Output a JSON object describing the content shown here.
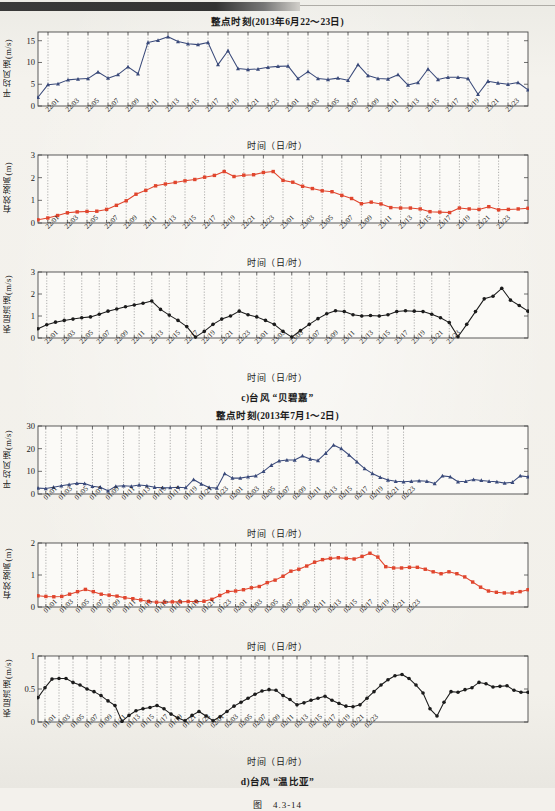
{
  "page": {
    "figure_number": "图",
    "figure_number_value": "4.3-14"
  },
  "groups": [
    {
      "id": "group-c",
      "caption": "c)台风 “贝碧嘉”",
      "title": "整点时刻(2013年6月22～23日)",
      "xaxis_label": "时间（日/时）",
      "xticks": [
        "22/01",
        "22/03",
        "22/05",
        "22/07",
        "22/09",
        "22/11",
        "22/13",
        "22/15",
        "22/17",
        "22/19",
        "22/21",
        "22/23",
        "23/01",
        "23/03",
        "23/05",
        "23/07",
        "23/09",
        "23/11",
        "23/13",
        "23/15",
        "23/17",
        "23/19",
        "23/21",
        "23/23"
      ]
    },
    {
      "id": "group-d",
      "caption": "d)台风 “温比亚”",
      "title": "整点时刻(2013年7月1～2日)",
      "xaxis_label": "时间（日/时）",
      "xticks": [
        "01/01",
        "01/03",
        "01/05",
        "01/07",
        "01/09",
        "01/11",
        "01/13",
        "01/15",
        "01/17",
        "01/19",
        "01/21",
        "01/23",
        "02/01",
        "02/03",
        "02/05",
        "02/07",
        "02/09",
        "02/11",
        "02/13",
        "02/15",
        "02/17",
        "02/19",
        "02/21",
        "02/23"
      ]
    }
  ],
  "chart_data": [
    {
      "id": "c-wind",
      "type": "line",
      "title": "整点时刻(2013年6月22～23日)",
      "xlabel": "时间（日/时）",
      "ylabel": "平均风速(m/s)",
      "ylim": [
        0,
        17
      ],
      "yticks": [
        0,
        5,
        10,
        15
      ],
      "grid": true,
      "marker": "triangle",
      "color": "#3a4a7a",
      "x": [
        "22/00",
        "22/01",
        "22/02",
        "22/03",
        "22/04",
        "22/05",
        "22/06",
        "22/07",
        "22/08",
        "22/09",
        "22/10",
        "22/11",
        "22/12",
        "22/13",
        "22/14",
        "22/15",
        "22/16",
        "22/17",
        "22/18",
        "22/19",
        "22/20",
        "22/21",
        "22/22",
        "22/23",
        "23/00",
        "23/01",
        "23/02",
        "23/03",
        "23/04",
        "23/05",
        "23/06",
        "23/07",
        "23/08",
        "23/09",
        "23/10",
        "23/11",
        "23/12",
        "23/13",
        "23/14",
        "23/15",
        "23/16",
        "23/17",
        "23/18",
        "23/19",
        "23/20",
        "23/21",
        "23/22",
        "23/23"
      ],
      "values": [
        2.0,
        4.9,
        5.1,
        6.0,
        6.2,
        6.3,
        7.8,
        6.4,
        7.2,
        9.0,
        7.4,
        14.6,
        15.1,
        15.9,
        14.8,
        14.3,
        14.1,
        14.6,
        9.5,
        12.7,
        8.6,
        8.4,
        8.5,
        8.9,
        9.1,
        9.2,
        6.3,
        7.9,
        6.3,
        6.1,
        6.4,
        5.9,
        9.5,
        7.0,
        6.3,
        6.2,
        7.2,
        4.8,
        5.4,
        8.5,
        6.1,
        6.6,
        6.6,
        6.3,
        2.7,
        5.7,
        5.3,
        5.0,
        5.4,
        3.7
      ]
    },
    {
      "id": "c-wave",
      "type": "line",
      "title": "",
      "xlabel": "时间（日/时）",
      "ylabel": "有效波高(m)",
      "ylim": [
        0,
        3
      ],
      "yticks": [
        0,
        1,
        2,
        3
      ],
      "grid": true,
      "marker": "square",
      "color": "#e0452d",
      "values": [
        0.14,
        0.22,
        0.33,
        0.45,
        0.49,
        0.51,
        0.52,
        0.6,
        0.78,
        0.98,
        1.27,
        1.44,
        1.64,
        1.72,
        1.79,
        1.86,
        1.92,
        2.02,
        2.1,
        2.27,
        2.05,
        2.11,
        2.13,
        2.23,
        2.27,
        1.88,
        1.8,
        1.62,
        1.52,
        1.42,
        1.38,
        1.22,
        1.08,
        0.85,
        0.92,
        0.84,
        0.68,
        0.66,
        0.66,
        0.62,
        0.5,
        0.48,
        0.46,
        0.66,
        0.62,
        0.6,
        0.72,
        0.58,
        0.6,
        0.62,
        0.65
      ]
    },
    {
      "id": "c-current",
      "type": "line",
      "title": "",
      "xlabel": "时间（日/时）",
      "ylabel": "表层流速(m/s)",
      "ylim": [
        0,
        3
      ],
      "yticks": [
        0,
        1,
        2,
        3
      ],
      "grid": true,
      "marker": "circle",
      "color": "#1b1b1b",
      "values": [
        0.42,
        0.6,
        0.72,
        0.8,
        0.86,
        0.92,
        0.96,
        1.08,
        1.22,
        1.32,
        1.42,
        1.5,
        1.58,
        1.68,
        1.3,
        1.04,
        0.8,
        0.52,
        0.04,
        0.3,
        0.62,
        0.86,
        1.0,
        1.22,
        1.06,
        0.96,
        0.8,
        0.62,
        0.3,
        0.04,
        0.34,
        0.62,
        0.88,
        1.1,
        1.24,
        1.2,
        1.06,
        1.0,
        1.02,
        1.0,
        1.06,
        1.2,
        1.24,
        1.22,
        1.2,
        1.08,
        0.92,
        0.7,
        0.06,
        0.62,
        1.2,
        1.78,
        1.9,
        2.26,
        1.72,
        1.48,
        1.22
      ]
    },
    {
      "id": "d-wind",
      "type": "line",
      "title": "整点时刻(2013年7月1～2日)",
      "xlabel": "时间（日/时）",
      "ylabel": "平均风速(m/s)",
      "ylim": [
        0,
        30
      ],
      "yticks": [
        0,
        10,
        20,
        30
      ],
      "grid": true,
      "marker": "triangle",
      "color": "#3a4a7a",
      "values": [
        2.6,
        2.4,
        3.0,
        3.6,
        4.2,
        4.7,
        4.6,
        3.4,
        3.0,
        1.4,
        3.4,
        3.6,
        3.4,
        4.0,
        3.6,
        3.0,
        2.7,
        2.8,
        3.0,
        2.8,
        6.4,
        4.4,
        2.9,
        2.6,
        9.0,
        7.0,
        7.0,
        7.6,
        8.0,
        10.0,
        12.7,
        14.6,
        15.0,
        15.0,
        16.8,
        15.4,
        14.8,
        18.0,
        21.6,
        20.0,
        17.2,
        14.2,
        11.2,
        9.0,
        7.4,
        6.2,
        5.6,
        5.4,
        5.6,
        5.8,
        5.6,
        4.6,
        8.0,
        7.6,
        5.4,
        5.6,
        6.4,
        6.0,
        5.6,
        5.4,
        4.8,
        5.2,
        8.0,
        7.6
      ]
    },
    {
      "id": "d-wave",
      "type": "line",
      "title": "",
      "xlabel": "时间（日/时）",
      "ylabel": "有效波高(m)",
      "ylim": [
        0,
        2
      ],
      "yticks": [
        0,
        1,
        2
      ],
      "grid": true,
      "marker": "square",
      "color": "#e0452d",
      "values": [
        0.35,
        0.33,
        0.32,
        0.33,
        0.4,
        0.48,
        0.55,
        0.48,
        0.4,
        0.37,
        0.34,
        0.29,
        0.26,
        0.22,
        0.17,
        0.15,
        0.15,
        0.16,
        0.16,
        0.17,
        0.17,
        0.18,
        0.24,
        0.36,
        0.48,
        0.5,
        0.54,
        0.6,
        0.64,
        0.76,
        0.84,
        0.96,
        1.12,
        1.18,
        1.28,
        1.4,
        1.48,
        1.52,
        1.54,
        1.52,
        1.5,
        1.58,
        1.68,
        1.56,
        1.26,
        1.22,
        1.22,
        1.24,
        1.24,
        1.18,
        1.1,
        1.04,
        1.1,
        1.04,
        0.94,
        0.78,
        0.62,
        0.5,
        0.46,
        0.44,
        0.44,
        0.48,
        0.54
      ]
    },
    {
      "id": "d-current",
      "type": "line",
      "title": "",
      "xlabel": "时间（日/时）",
      "ylabel": "表层流速(m/s)",
      "ylim": [
        0,
        1
      ],
      "yticks": [
        0,
        0.5,
        1
      ],
      "grid": true,
      "marker": "circle",
      "color": "#1b1b1b",
      "values": [
        0.37,
        0.52,
        0.65,
        0.66,
        0.66,
        0.6,
        0.56,
        0.5,
        0.46,
        0.4,
        0.32,
        0.25,
        0.01,
        0.1,
        0.17,
        0.2,
        0.22,
        0.25,
        0.2,
        0.12,
        0.06,
        0.02,
        0.1,
        0.16,
        0.09,
        0.02,
        0.08,
        0.16,
        0.24,
        0.3,
        0.36,
        0.42,
        0.47,
        0.49,
        0.48,
        0.4,
        0.34,
        0.26,
        0.29,
        0.33,
        0.36,
        0.39,
        0.33,
        0.28,
        0.24,
        0.23,
        0.26,
        0.36,
        0.46,
        0.56,
        0.64,
        0.7,
        0.72,
        0.66,
        0.56,
        0.44,
        0.2,
        0.09,
        0.3,
        0.46,
        0.45,
        0.49,
        0.52,
        0.6,
        0.58,
        0.53,
        0.54,
        0.55,
        0.48,
        0.45,
        0.45
      ]
    }
  ]
}
